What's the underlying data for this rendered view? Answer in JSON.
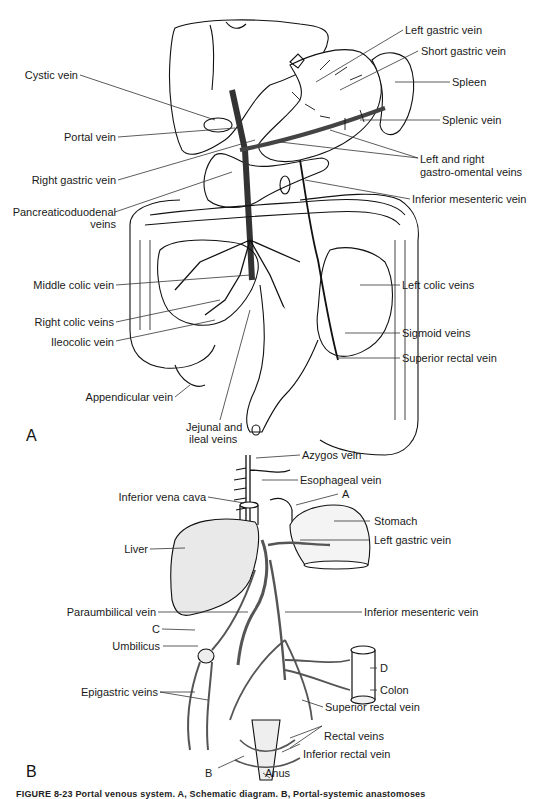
{
  "figure": {
    "panels": [
      "A",
      "B"
    ],
    "caption_partial": "FIGURE 8-23 Portal venous system. A, Schematic diagram. B, Portal-systemic anastomoses"
  },
  "panel_a": {
    "labels": {
      "left_gastric_vein": "Left gastric vein",
      "short_gastric_vein": "Short gastric vein",
      "spleen": "Spleen",
      "cystic_vein": "Cystic vein",
      "portal_vein": "Portal vein",
      "splenic_vein": "Splenic vein",
      "right_gastric_vein": "Right gastric vein",
      "gastro_omental_line1": "Left and right",
      "gastro_omental_line2": "gastro-omental veins",
      "pancreaticoduodenal_line1": "Pancreaticoduodenal",
      "pancreaticoduodenal_line2": "veins",
      "inferior_mesenteric_vein": "Inferior mesenteric vein",
      "middle_colic_vein": "Middle colic vein",
      "left_colic_veins": "Left colic veins",
      "right_colic_veins": "Right colic veins",
      "sigmoid_veins": "Sigmoid veins",
      "ileocolic_vein": "Ileocolic vein",
      "superior_rectal_vein": "Superior rectal vein",
      "appendicular_vein": "Appendicular vein",
      "jejunal_line1": "Jejunal and",
      "jejunal_line2": "ileal veins"
    }
  },
  "panel_b": {
    "labels": {
      "azygos_vein": "Azygos vein",
      "esophageal_vein": "Esophageal vein",
      "inferior_vena_cava": "Inferior vena cava",
      "marker_a": "A",
      "stomach": "Stomach",
      "liver": "Liver",
      "left_gastric_vein": "Left gastric vein",
      "paraumbilical_vein": "Paraumbilical vein",
      "inferior_mesenteric_vein": "Inferior mesenteric vein",
      "marker_c": "C",
      "umbilicus": "Umbilicus",
      "marker_d": "D",
      "colon": "Colon",
      "epigastric_veins": "Epigastric veins",
      "superior_rectal_vein": "Superior rectal vein",
      "rectal_veins": "Rectal veins",
      "inferior_rectal_vein": "Inferior rectal vein",
      "marker_b": "B",
      "anus": "Anus"
    }
  }
}
